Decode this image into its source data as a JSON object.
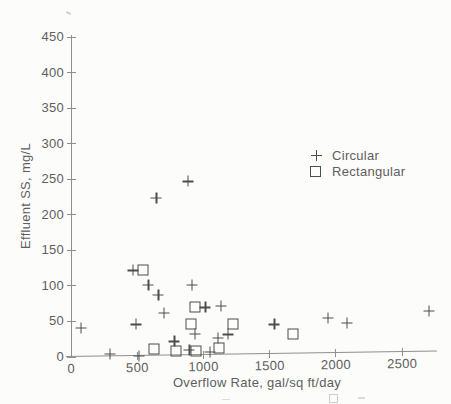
{
  "colors": {
    "axis": "#8f8f8f",
    "text": "#5e5e5e",
    "marker": "#4d4d4d",
    "paper": "#fcfcfb"
  },
  "chart_data": {
    "type": "scatter",
    "title": "",
    "xlabel": "Overflow Rate, gal/sq ft/day",
    "ylabel": "Effluent SS, mg/L",
    "xlim": [
      0,
      2765
    ],
    "ylim": [
      0,
      453
    ],
    "xticks": [
      0,
      500,
      1000,
      1500,
      2000,
      2500
    ],
    "yticks": [
      0,
      50,
      100,
      150,
      200,
      250,
      300,
      350,
      400,
      450
    ],
    "grid": false,
    "legend_position": "inside-upper-right",
    "series": [
      {
        "name": "Circular",
        "marker": "plus",
        "points": [
          [
            75,
            41
          ],
          [
            295,
            4
          ],
          [
            465,
            122
          ],
          [
            490,
            46
          ],
          [
            515,
            2
          ],
          [
            585,
            101
          ],
          [
            645,
            224
          ],
          [
            660,
            87
          ],
          [
            700,
            62
          ],
          [
            780,
            22
          ],
          [
            885,
            247
          ],
          [
            895,
            10
          ],
          [
            915,
            101
          ],
          [
            935,
            33
          ],
          [
            1015,
            70
          ],
          [
            1050,
            7
          ],
          [
            1110,
            27
          ],
          [
            1130,
            72
          ],
          [
            1185,
            32
          ],
          [
            1535,
            46
          ],
          [
            1940,
            55
          ],
          [
            2085,
            48
          ],
          [
            2705,
            65
          ]
        ]
      },
      {
        "name": "Rectangular",
        "marker": "square",
        "points": [
          [
            545,
            122
          ],
          [
            625,
            11
          ],
          [
            790,
            9
          ],
          [
            905,
            47
          ],
          [
            940,
            70
          ],
          [
            945,
            8
          ],
          [
            1115,
            13
          ],
          [
            1220,
            47
          ],
          [
            1675,
            33
          ]
        ]
      }
    ]
  }
}
